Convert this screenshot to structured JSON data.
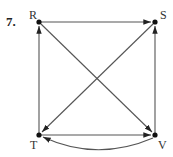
{
  "problem": {
    "number": "7."
  },
  "graph": {
    "type": "directed",
    "nodes": [
      {
        "id": "R",
        "label": "R",
        "x": 39,
        "y": 22
      },
      {
        "id": "S",
        "label": "S",
        "x": 155,
        "y": 22
      },
      {
        "id": "T",
        "label": "T",
        "x": 39,
        "y": 135
      },
      {
        "id": "V",
        "label": "V",
        "x": 155,
        "y": 135
      }
    ],
    "edges": [
      {
        "from": "R",
        "to": "S",
        "shape": "straight"
      },
      {
        "from": "T",
        "to": "R",
        "shape": "straight"
      },
      {
        "from": "V",
        "to": "S",
        "shape": "straight"
      },
      {
        "from": "S",
        "to": "T",
        "shape": "straight"
      },
      {
        "from": "R",
        "to": "V",
        "shape": "straight"
      },
      {
        "from": "T",
        "to": "V",
        "shape": "straight"
      },
      {
        "from": "V",
        "to": "T",
        "shape": "curved"
      }
    ]
  },
  "colors": {
    "edge": "#555555",
    "node": "#111111",
    "text": "#333333"
  }
}
